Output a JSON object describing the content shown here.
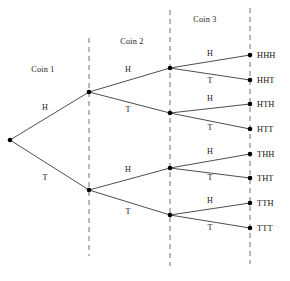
{
  "diagram": {
    "background_color": "#ffffff",
    "edge_color": "#3a3a3a",
    "node_color": "#000000",
    "divider_color": "#808080",
    "text_color": "#1a1a1a",
    "stage_labels": [
      {
        "id": "coin-1",
        "text": "Coin 1",
        "x": 43,
        "y": 72
      },
      {
        "id": "coin-2",
        "text": "Coin 2",
        "x": 132,
        "y": 44
      },
      {
        "id": "coin-3",
        "text": "Coin 3",
        "x": 205,
        "y": 22
      }
    ],
    "dividers": [
      {
        "id": "divider-1",
        "x": 89,
        "y1": 38,
        "y2": 256
      },
      {
        "id": "divider-2",
        "x": 170,
        "y1": 10,
        "y2": 266
      },
      {
        "id": "divider-3",
        "x": 250,
        "y1": 8,
        "y2": 264
      }
    ],
    "nodes": [
      {
        "id": "root",
        "x": 10,
        "y": 140
      },
      {
        "id": "H",
        "x": 89,
        "y": 92
      },
      {
        "id": "T",
        "x": 89,
        "y": 190
      },
      {
        "id": "HH",
        "x": 170,
        "y": 68
      },
      {
        "id": "HT",
        "x": 170,
        "y": 113
      },
      {
        "id": "TH",
        "x": 170,
        "y": 168
      },
      {
        "id": "TT",
        "x": 170,
        "y": 215
      },
      {
        "id": "HHH",
        "x": 250,
        "y": 55
      },
      {
        "id": "HHT",
        "x": 250,
        "y": 80
      },
      {
        "id": "HTH",
        "x": 250,
        "y": 104
      },
      {
        "id": "HTT",
        "x": 250,
        "y": 129
      },
      {
        "id": "THH",
        "x": 250,
        "y": 154
      },
      {
        "id": "THT",
        "x": 250,
        "y": 178
      },
      {
        "id": "TTH",
        "x": 250,
        "y": 203
      },
      {
        "id": "TTT",
        "x": 250,
        "y": 228
      }
    ],
    "edges": [
      {
        "id": "edge-root-H",
        "from": "root",
        "to": "H",
        "label": "H",
        "lx": 45,
        "ly": 110
      },
      {
        "id": "edge-root-T",
        "from": "root",
        "to": "T",
        "label": "T",
        "lx": 45,
        "ly": 180
      },
      {
        "id": "edge-H-HH",
        "from": "H",
        "to": "HH",
        "label": "H",
        "lx": 128,
        "ly": 72
      },
      {
        "id": "edge-H-HT",
        "from": "H",
        "to": "HT",
        "label": "T",
        "lx": 128,
        "ly": 112
      },
      {
        "id": "edge-T-TH",
        "from": "T",
        "to": "TH",
        "label": "H",
        "lx": 128,
        "ly": 172
      },
      {
        "id": "edge-T-TT",
        "from": "T",
        "to": "TT",
        "label": "T",
        "lx": 128,
        "ly": 214
      },
      {
        "id": "edge-HH-HHH",
        "from": "HH",
        "to": "HHH",
        "label": "H",
        "lx": 210,
        "ly": 56
      },
      {
        "id": "edge-HH-HHT",
        "from": "HH",
        "to": "HHT",
        "label": "T",
        "lx": 210,
        "ly": 83
      },
      {
        "id": "edge-HT-HTH",
        "from": "HT",
        "to": "HTH",
        "label": "H",
        "lx": 210,
        "ly": 101
      },
      {
        "id": "edge-HT-HTT",
        "from": "HT",
        "to": "HTT",
        "label": "T",
        "lx": 210,
        "ly": 130
      },
      {
        "id": "edge-TH-THH",
        "from": "TH",
        "to": "THH",
        "label": "H",
        "lx": 210,
        "ly": 154
      },
      {
        "id": "edge-TH-THT",
        "from": "TH",
        "to": "THT",
        "label": "T",
        "lx": 210,
        "ly": 180
      },
      {
        "id": "edge-TT-TTH",
        "from": "TT",
        "to": "TTH",
        "label": "H",
        "lx": 210,
        "ly": 203
      },
      {
        "id": "edge-TT-TTT",
        "from": "TT",
        "to": "TTT",
        "label": "T",
        "lx": 210,
        "ly": 230
      }
    ],
    "outcomes": [
      {
        "id": "outcome-HHH",
        "text": "HHH",
        "x": 257,
        "y": 58
      },
      {
        "id": "outcome-HHT",
        "text": "HHT",
        "x": 257,
        "y": 83
      },
      {
        "id": "outcome-HTH",
        "text": "HTH",
        "x": 257,
        "y": 107
      },
      {
        "id": "outcome-HTT",
        "text": "HTT",
        "x": 257,
        "y": 132
      },
      {
        "id": "outcome-THH",
        "text": "THH",
        "x": 257,
        "y": 157
      },
      {
        "id": "outcome-THT",
        "text": "THT",
        "x": 257,
        "y": 181
      },
      {
        "id": "outcome-TTH",
        "text": "TTH",
        "x": 257,
        "y": 206
      },
      {
        "id": "outcome-TTT",
        "text": "TTT",
        "x": 257,
        "y": 231
      }
    ]
  }
}
